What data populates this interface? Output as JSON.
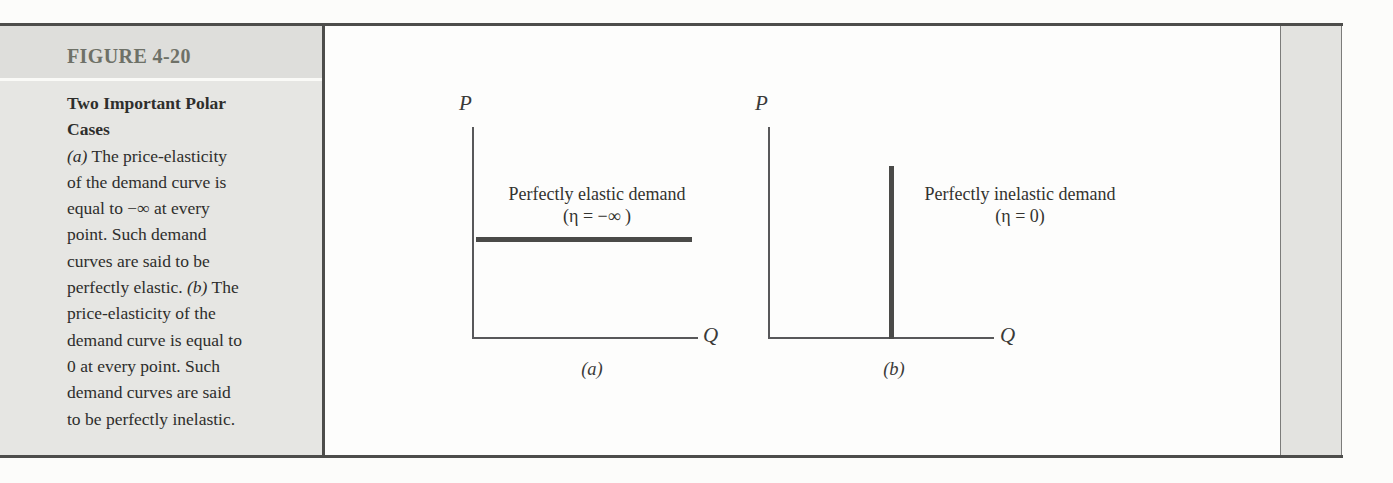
{
  "figure": {
    "id_label": "FIGURE 4-20",
    "caption": {
      "title_line1": "Two Important Polar",
      "title_line2": "Cases",
      "a_marker": "(a)",
      "line3_rest": " The price-elasticity",
      "line4": "of the demand curve is",
      "line5": "equal to −∞ at every",
      "line6": "point. Such demand",
      "line7": "curves are said to be",
      "line8_a": "perfectly elastic. ",
      "b_marker": "(b)",
      "line8_b": " The",
      "line9": "price-elasticity of the",
      "line10": "demand curve is equal to",
      "line11": "0 at every point. Such",
      "line12": "demand curves are said",
      "line13": "to be perfectly inelastic."
    }
  },
  "panels": {
    "a": {
      "p_axis_label": "P",
      "q_axis_label": "Q",
      "curve_label_line1": "Perfectly elastic demand",
      "curve_label_line2": "(η = −∞ )",
      "panel_label": "(a)"
    },
    "b": {
      "p_axis_label": "P",
      "q_axis_label": "Q",
      "curve_label_line1": "Perfectly inelastic demand",
      "curve_label_line2": "(η = 0)",
      "panel_label": "(b)"
    }
  },
  "colors": {
    "sidebar_bg": "#e6e6e3",
    "sidebar_header_bg": "#dededb",
    "frame_rule": "#4d4d4b",
    "figure_label_text": "#6e7167",
    "caption_text": "#2e2e2c",
    "axis": "#58585a",
    "demand_curve": "#4a4a48",
    "page_bg": "#fcfcfa"
  },
  "chart_data": [
    {
      "type": "line",
      "title": "Perfectly elastic demand",
      "annotation": "(η = −∞ )",
      "xlabel": "Q",
      "ylabel": "P",
      "xlim": [
        0,
        1
      ],
      "ylim": [
        0,
        1
      ],
      "grid": false,
      "ticks": "none",
      "series": [
        {
          "name": "Perfectly elastic demand curve (horizontal at constant price)",
          "points": [
            {
              "x": 0.01,
              "y": 0.48
            },
            {
              "x": 0.97,
              "y": 0.48
            }
          ]
        }
      ],
      "panel_label": "(a)"
    },
    {
      "type": "line",
      "title": "Perfectly inelastic demand",
      "annotation": "(η = 0)",
      "xlabel": "Q",
      "ylabel": "P",
      "xlim": [
        0,
        1
      ],
      "ylim": [
        0,
        1
      ],
      "grid": false,
      "ticks": "none",
      "series": [
        {
          "name": "Perfectly inelastic demand curve (vertical at constant quantity)",
          "points": [
            {
              "x": 0.54,
              "y": 0.0
            },
            {
              "x": 0.54,
              "y": 0.81
            }
          ]
        }
      ],
      "panel_label": "(b)"
    }
  ]
}
